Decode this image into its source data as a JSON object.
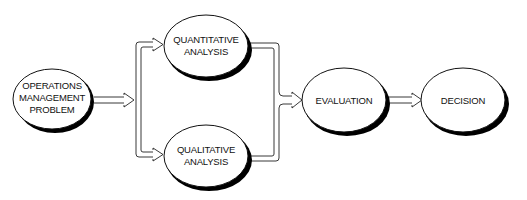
{
  "diagram": {
    "type": "flowchart",
    "nodes": {
      "problem": {
        "lines": [
          "OPERATIONS",
          "MANAGEMENT",
          "PROBLEM"
        ]
      },
      "quantitative": {
        "lines": [
          "QUANTITATIVE",
          "ANALYSIS"
        ]
      },
      "qualitative": {
        "lines": [
          "QUALITATIVE",
          "ANALYSIS"
        ]
      },
      "evaluation": {
        "lines": [
          "EVALUATION"
        ]
      },
      "decision": {
        "lines": [
          "DECISION"
        ]
      }
    },
    "edges": [
      {
        "from": "OPERATIONS MANAGEMENT PROBLEM",
        "to": "QUANTITATIVE ANALYSIS"
      },
      {
        "from": "OPERATIONS MANAGEMENT PROBLEM",
        "to": "QUALITATIVE ANALYSIS"
      },
      {
        "from": "QUANTITATIVE ANALYSIS",
        "to": "EVALUATION"
      },
      {
        "from": "QUALITATIVE ANALYSIS",
        "to": "EVALUATION"
      },
      {
        "from": "EVALUATION",
        "to": "DECISION"
      }
    ],
    "colors": {
      "stroke": "#111111",
      "fill": "#ffffff",
      "shadow": "#000000"
    }
  }
}
